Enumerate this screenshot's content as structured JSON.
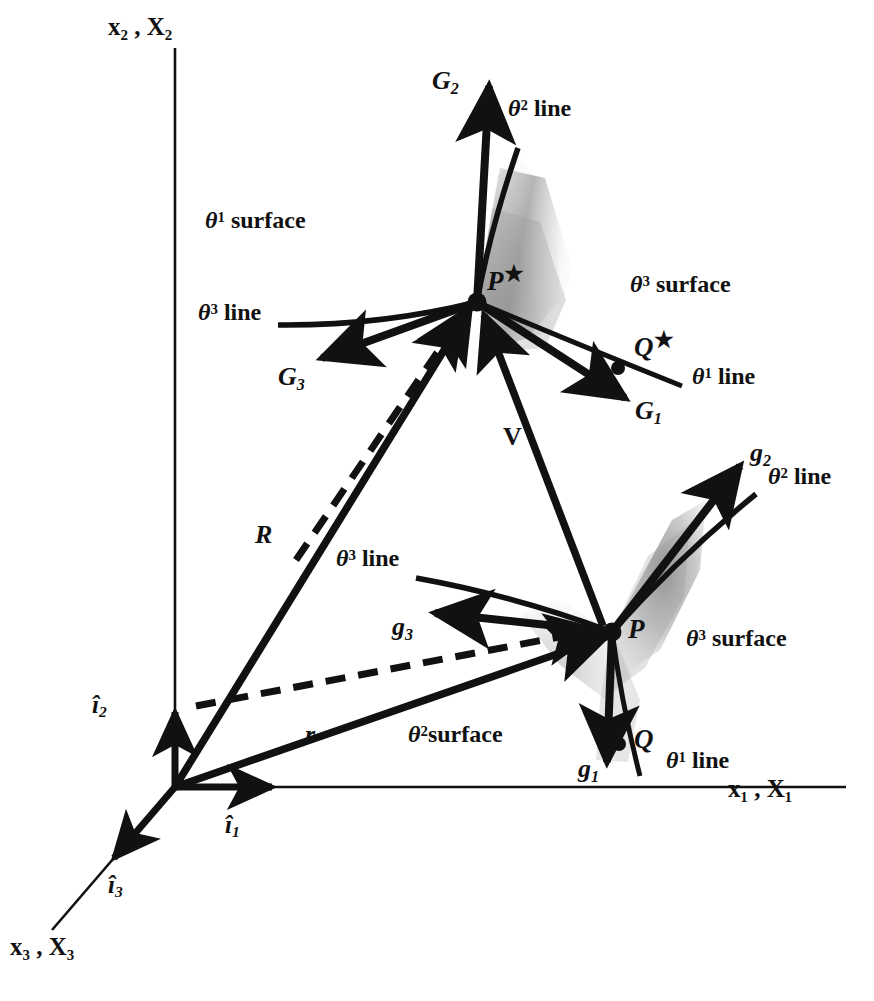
{
  "figure": {
    "background_color": "#ffffff",
    "ink_color": "#111111",
    "shade_color": "#9a9a9a"
  },
  "axes": [
    {
      "name": "x2-axis",
      "label_x": "x",
      "label_sub": "2",
      "label_X": "X",
      "label_X_sub": "2",
      "text": "x₂ , X₂"
    },
    {
      "name": "x1-axis",
      "label_x": "x",
      "label_sub": "1",
      "label_X": "X",
      "label_X_sub": "1",
      "text": "x₁ , X₁"
    },
    {
      "name": "x3-axis",
      "label_x": "x",
      "label_sub": "3",
      "label_X": "X",
      "label_X_sub": "3",
      "text": "x₃ , X₃"
    }
  ],
  "unit_vectors": [
    {
      "name": "i1",
      "symbol": "i",
      "sub": "1",
      "hat": true
    },
    {
      "name": "i2",
      "symbol": "i",
      "sub": "2",
      "hat": true
    },
    {
      "name": "i3",
      "symbol": "i",
      "sub": "3",
      "hat": true
    }
  ],
  "position_vectors": [
    {
      "name": "R",
      "symbol": "R",
      "description": "reference position vector to P-star"
    },
    {
      "name": "r",
      "symbol": "r",
      "description": "current position vector to P"
    },
    {
      "name": "V",
      "symbol": "V",
      "description": "displacement vector from P-star to P"
    }
  ],
  "points": [
    {
      "name": "P-star",
      "symbol": "P",
      "star": true
    },
    {
      "name": "Q-star",
      "symbol": "Q",
      "star": true
    },
    {
      "name": "P",
      "symbol": "P",
      "star": false
    },
    {
      "name": "Q",
      "symbol": "Q",
      "star": false
    }
  ],
  "reference_basis": [
    {
      "name": "G1",
      "symbol": "G",
      "sub": "1"
    },
    {
      "name": "G2",
      "symbol": "G",
      "sub": "2"
    },
    {
      "name": "G3",
      "symbol": "G",
      "sub": "3"
    }
  ],
  "current_basis": [
    {
      "name": "g1",
      "symbol": "g",
      "sub": "1"
    },
    {
      "name": "g2",
      "symbol": "g",
      "sub": "2"
    },
    {
      "name": "g3",
      "symbol": "g",
      "sub": "3"
    }
  ],
  "labels": {
    "theta1_surface": {
      "theta": "θ",
      "sup": "1",
      "word": "surface"
    },
    "theta3_surface_upper": {
      "theta": "θ",
      "sup": "3",
      "word": "surface"
    },
    "theta3_surface_lower": {
      "theta": "θ",
      "sup": "3",
      "word": "surface"
    },
    "theta2_surface": {
      "theta": "θ",
      "sup": "2",
      "word": "surface"
    },
    "theta1_line_upper": {
      "theta": "θ",
      "sup": "1",
      "word": "line"
    },
    "theta2_line_upper": {
      "theta": "θ",
      "sup": "2",
      "word": "line"
    },
    "theta3_line_upper": {
      "theta": "θ",
      "sup": "3",
      "word": "line"
    },
    "theta1_line_lower": {
      "theta": "θ",
      "sup": "1",
      "word": "line"
    },
    "theta2_line_lower": {
      "theta": "θ",
      "sup": "2",
      "word": "line"
    },
    "theta3_line_lower": {
      "theta": "θ",
      "sup": "3",
      "word": "line"
    }
  }
}
